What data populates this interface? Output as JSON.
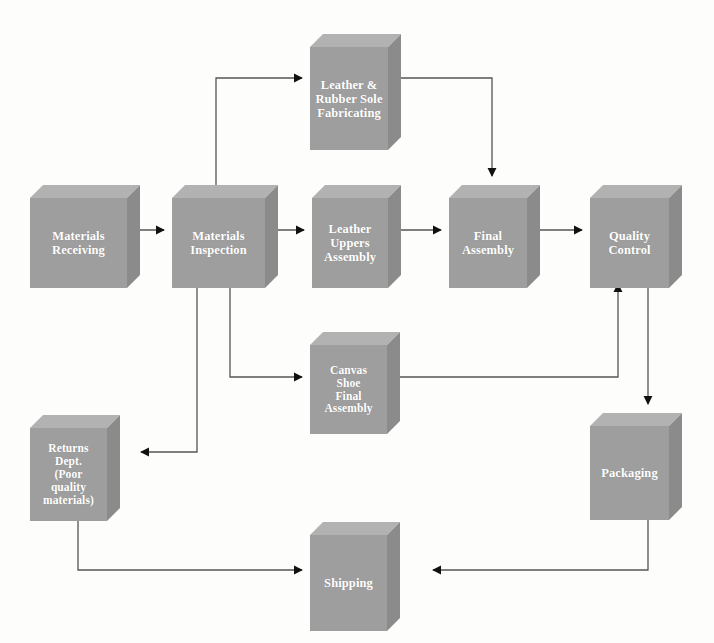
{
  "diagram": {
    "style": {
      "box_front_color": "#9e9e9e",
      "box_top_color": "#b2b2b2",
      "box_side_color": "#8b8b8b",
      "label_color": "#ffffff",
      "edge_color": "#555555",
      "background_color": "#fdfdfc"
    },
    "nodes": [
      {
        "id": "materials-receiving",
        "label": "Materials\nReceiving",
        "x": 30,
        "y": 185,
        "w": 97,
        "h": 90,
        "depth": 13
      },
      {
        "id": "materials-inspection",
        "label": "Materials\nInspection",
        "x": 172,
        "y": 185,
        "w": 93,
        "h": 90,
        "depth": 13
      },
      {
        "id": "leather-rubber-sole",
        "label": "Leather &\nRubber Sole\nFabricating",
        "x": 310,
        "y": 34,
        "w": 78,
        "h": 103,
        "depth": 13
      },
      {
        "id": "leather-uppers",
        "label": "Leather\nUppers\nAssembly",
        "x": 312,
        "y": 185,
        "w": 76,
        "h": 90,
        "depth": 13
      },
      {
        "id": "final-assembly",
        "label": "Final\nAssembly",
        "x": 449,
        "y": 185,
        "w": 78,
        "h": 90,
        "depth": 13
      },
      {
        "id": "quality-control",
        "label": "Quality\nControl",
        "x": 590,
        "y": 185,
        "w": 79,
        "h": 90,
        "depth": 13
      },
      {
        "id": "canvas-shoe",
        "label": "Canvas\nShoe\nFinal\nAssembly",
        "x": 310,
        "y": 332,
        "w": 77,
        "h": 89,
        "depth": 13
      },
      {
        "id": "returns-dept",
        "label": "Returns\nDept.\n(Poor\nquality\nmaterials)",
        "x": 30,
        "y": 415,
        "w": 77,
        "h": 93,
        "depth": 13
      },
      {
        "id": "packaging",
        "label": "Packaging",
        "x": 590,
        "y": 413,
        "w": 79,
        "h": 94,
        "depth": 13
      },
      {
        "id": "shipping",
        "label": "Shipping",
        "x": 310,
        "y": 522,
        "w": 77,
        "h": 96,
        "depth": 13
      }
    ],
    "edges": [
      {
        "id": "edge-receiving-to-inspection",
        "from": "materials-receiving",
        "to": "materials-inspection",
        "path": "M 128 230 L 164 230",
        "arrow": "right"
      },
      {
        "id": "edge-inspection-to-sole",
        "from": "materials-inspection",
        "to": "leather-rubber-sole",
        "path": "M 216 185 L 216 78 L 302 78",
        "arrow": "right"
      },
      {
        "id": "edge-sole-to-final-assembly",
        "from": "leather-rubber-sole",
        "to": "final-assembly",
        "path": "M 401 78 L 492 78 L 492 176",
        "arrow": "down"
      },
      {
        "id": "edge-inspection-to-uppers",
        "from": "materials-inspection",
        "to": "leather-uppers",
        "path": "M 266 230 L 304 230",
        "arrow": "right"
      },
      {
        "id": "edge-uppers-to-final-assembly",
        "from": "leather-uppers",
        "to": "final-assembly",
        "path": "M 401 230 L 441 230",
        "arrow": "right"
      },
      {
        "id": "edge-final-assembly-to-quality",
        "from": "final-assembly",
        "to": "quality-control",
        "path": "M 540 230 L 582 230",
        "arrow": "right"
      },
      {
        "id": "edge-inspection-to-canvas",
        "from": "materials-inspection",
        "to": "canvas-shoe",
        "path": "M 230 276 L 230 377 L 302 377",
        "arrow": "right"
      },
      {
        "id": "edge-inspection-to-returns",
        "from": "materials-inspection",
        "to": "returns-dept",
        "path": "M 197 276 L 197 452 L 141 452",
        "arrow": "left"
      },
      {
        "id": "edge-canvas-to-quality",
        "from": "canvas-shoe",
        "to": "quality-control",
        "path": "M 400 377 L 618 377 L 618 284",
        "arrow": "up"
      },
      {
        "id": "edge-quality-to-packaging",
        "from": "quality-control",
        "to": "packaging",
        "path": "M 648 276 L 648 404",
        "arrow": "down"
      },
      {
        "id": "edge-packaging-to-shipping",
        "from": "packaging",
        "to": "shipping",
        "path": "M 648 508 L 648 570 L 433 570",
        "arrow": "left"
      },
      {
        "id": "edge-returns-to-shipping",
        "from": "returns-dept",
        "to": "shipping",
        "path": "M 78 509 L 78 570 L 302 570",
        "arrow": "right"
      }
    ]
  }
}
